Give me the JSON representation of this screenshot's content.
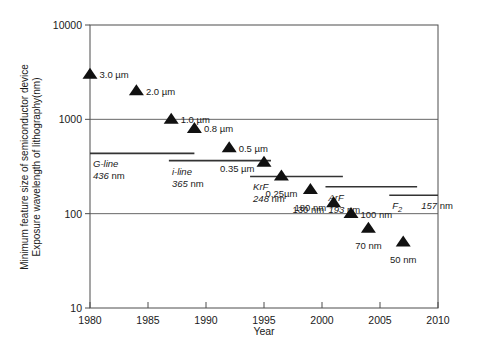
{
  "chart_data": {
    "type": "scatter",
    "title": "",
    "xlabel": "Year",
    "ylabel_line1": "Minimum feature size of semiconductor device",
    "ylabel_line2": "Exposure wavelength of lithography(nm)",
    "xlim": [
      1980,
      2010
    ],
    "ylim": [
      10,
      10000
    ],
    "yscale": "log",
    "grid": true,
    "legend": "none",
    "xticks": [
      "1980",
      "1985",
      "1990",
      "1995",
      "2000",
      "2005",
      "2010"
    ],
    "xtick_values": [
      1980,
      1985,
      1990,
      1995,
      2000,
      2005,
      2010
    ],
    "yticks": [
      "10000",
      "1000",
      "100",
      "10"
    ],
    "ytick_values": [
      10000,
      1000,
      100,
      10
    ],
    "series": [
      {
        "name": "Minimum feature size",
        "marker": "triangle",
        "points": [
          {
            "x": 1980.0,
            "y": 3000,
            "label": "3.0 µm",
            "label_pos": "right"
          },
          {
            "x": 1984.0,
            "y": 2000,
            "label": "2.0 µm",
            "label_pos": "right"
          },
          {
            "x": 1987.0,
            "y": 1000,
            "label": "1.0 µm",
            "label_pos": "right"
          },
          {
            "x": 1989.0,
            "y": 800,
            "label": "0.8 µm",
            "label_pos": "right"
          },
          {
            "x": 1992.0,
            "y": 500,
            "label": "0.5 µm",
            "label_pos": "right"
          },
          {
            "x": 1995.0,
            "y": 350,
            "label": "0.35 µm",
            "label_pos": "belowleft"
          },
          {
            "x": 1996.5,
            "y": 250,
            "label": "0.25µm",
            "label_pos": "below"
          },
          {
            "x": 1999.0,
            "y": 180,
            "label": "180 nm",
            "label_pos": "below"
          },
          {
            "x": 2001.0,
            "y": 130,
            "label": "130 nm",
            "label_pos": "belowleft"
          },
          {
            "x": 2002.5,
            "y": 100,
            "label": "100 nm",
            "label_pos": "right"
          },
          {
            "x": 2004.0,
            "y": 70,
            "label": "70 nm",
            "label_pos": "below"
          },
          {
            "x": 2007.0,
            "y": 50,
            "label": "50 nm",
            "label_pos": "below"
          }
        ]
      }
    ],
    "wavelength_bars": [
      {
        "name": "G-line",
        "wavelength": "436",
        "unit": "nm",
        "x_start": 1980.0,
        "x_end": 1989.0,
        "y": 436
      },
      {
        "name": "i-line",
        "wavelength": "365",
        "unit": "nm",
        "x_start": 1986.8,
        "x_end": 1995.6,
        "y": 365
      },
      {
        "name": "KrF",
        "wavelength": "248",
        "unit": "nm",
        "x_start": 1993.8,
        "x_end": 2001.8,
        "y": 248
      },
      {
        "name": "ArF",
        "wavelength": "193",
        "unit": "nm",
        "x_start": 2000.3,
        "x_end": 2008.2,
        "y": 193
      },
      {
        "name": "F2",
        "wavelength": "157",
        "unit": "nm",
        "x_start": 2005.8,
        "x_end": 2012.8,
        "y": 157,
        "subscript": "2"
      }
    ]
  }
}
